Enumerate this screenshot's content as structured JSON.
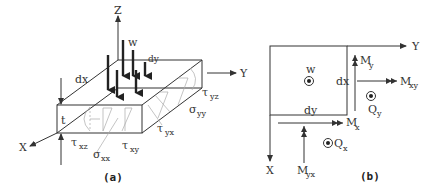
{
  "figure_a": {
    "caption": "(a)",
    "axes": {
      "x": "X",
      "y": "Y",
      "z": "Z"
    },
    "labels": {
      "w": "w",
      "dy": "dy",
      "dx": "dx",
      "t": "t",
      "tau": "τ",
      "sigma": "σ",
      "tau_xz_sub": "xz",
      "sigma_xx_sub": "xx",
      "tau_xy_sub": "xy",
      "tau_yx_sub": "yx",
      "sigma_yy_sub": "yy",
      "tau_yz_sub": "yz"
    }
  },
  "figure_b": {
    "caption": "(b)",
    "axes": {
      "x": "X",
      "y": "Y"
    },
    "labels": {
      "w": "w",
      "dx": "dx",
      "dy": "dy",
      "M": "M",
      "Q": "Q",
      "My_sub": "y",
      "Mxy_sub": "xy",
      "Qy_sub": "y",
      "Mx_sub": "x",
      "Qx_sub": "x",
      "Myx_sub": "yx"
    }
  }
}
